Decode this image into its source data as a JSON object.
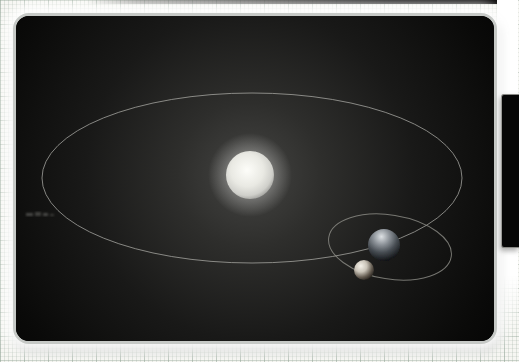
{
  "page": {
    "paper_color": "#f6f6f2",
    "grid_color": "#a5b4a8"
  },
  "top_edge_shadow": {
    "color": "#000000"
  },
  "side_window": {
    "color": "#060606"
  },
  "scene": {
    "panel_background": "#000000",
    "glow_center_color": "#454543",
    "sun": {
      "cx": 234,
      "cy": 159,
      "r": 24,
      "core": "#fdfdf9",
      "mid": "#e9e9e3",
      "edge": "#a3a39f"
    },
    "planet": {
      "cx": 368,
      "cy": 229,
      "r": 16,
      "light": "#dde1e4",
      "mid": "#8c9298",
      "dark": "#0a0c0e"
    },
    "moon": {
      "cx": 348,
      "cy": 254,
      "r": 10,
      "light": "#f4f1e9",
      "mid": "#c9c3b8",
      "dark": "#171310"
    },
    "planet_orbit": {
      "cx": 236,
      "cy": 162,
      "rx": 210,
      "ry": 85,
      "stroke": "#a2a29e"
    },
    "moon_orbit": {
      "cx": 374,
      "cy": 231,
      "rx": 62,
      "ry": 32,
      "rotation": 9,
      "transform": "rotate(9 374 231)",
      "stroke": "#96968f"
    }
  }
}
